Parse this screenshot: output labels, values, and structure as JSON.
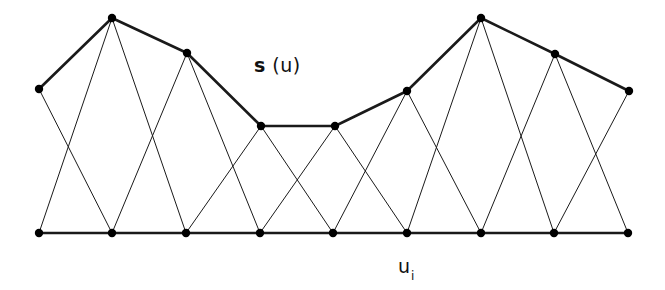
{
  "figure": {
    "background_color": "#ffffff",
    "stroke_color": "#1a1a1a",
    "vertex_color": "#000000",
    "thin_stroke_width": 1,
    "thick_stroke_width": 2.6,
    "vertex_radius": 4.2,
    "width": 665,
    "height": 290
  },
  "labels": {
    "curve_label_symbol": "s",
    "curve_label_argument": " (u)",
    "curve_label_full": "s (u)",
    "baseline_label_symbol": "u",
    "baseline_label_subscript": "i",
    "baseline_label_full": "u i"
  },
  "chart_data": {
    "type": "scatter",
    "title": "",
    "xlabel": "u i",
    "ylabel": "s (u)",
    "xlim": [
      0,
      665
    ],
    "ylim": [
      290,
      0
    ],
    "grid": false,
    "legend": "none",
    "series": [
      {
        "name": "s(u) control polygon (upper polyline)",
        "style": "thick-polyline-with-markers",
        "points": [
          {
            "x": 39,
            "y": 89
          },
          {
            "x": 112,
            "y": 18
          },
          {
            "x": 187,
            "y": 53
          },
          {
            "x": 261,
            "y": 126
          },
          {
            "x": 335,
            "y": 126
          },
          {
            "x": 407,
            "y": 91
          },
          {
            "x": 481,
            "y": 18
          },
          {
            "x": 555,
            "y": 54
          },
          {
            "x": 629,
            "y": 91
          }
        ]
      },
      {
        "name": "u_i baseline (lower polyline)",
        "style": "thick-polyline-with-markers",
        "points": [
          {
            "x": 39,
            "y": 233
          },
          {
            "x": 112,
            "y": 233
          },
          {
            "x": 186,
            "y": 233
          },
          {
            "x": 260,
            "y": 233
          },
          {
            "x": 333,
            "y": 233
          },
          {
            "x": 407,
            "y": 233
          },
          {
            "x": 481,
            "y": 233
          },
          {
            "x": 554,
            "y": 233
          },
          {
            "x": 628,
            "y": 233
          }
        ]
      }
    ],
    "connector_edges": [
      {
        "top_index": 0,
        "bottom_index": 1
      },
      {
        "top_index": 1,
        "bottom_index": 0
      },
      {
        "top_index": 1,
        "bottom_index": 2
      },
      {
        "top_index": 2,
        "bottom_index": 1
      },
      {
        "top_index": 2,
        "bottom_index": 3
      },
      {
        "top_index": 3,
        "bottom_index": 2
      },
      {
        "top_index": 3,
        "bottom_index": 4
      },
      {
        "top_index": 4,
        "bottom_index": 3
      },
      {
        "top_index": 4,
        "bottom_index": 5
      },
      {
        "top_index": 5,
        "bottom_index": 4
      },
      {
        "top_index": 5,
        "bottom_index": 6
      },
      {
        "top_index": 6,
        "bottom_index": 5
      },
      {
        "top_index": 6,
        "bottom_index": 7
      },
      {
        "top_index": 7,
        "bottom_index": 6
      },
      {
        "top_index": 7,
        "bottom_index": 8
      },
      {
        "top_index": 8,
        "bottom_index": 7
      }
    ]
  }
}
